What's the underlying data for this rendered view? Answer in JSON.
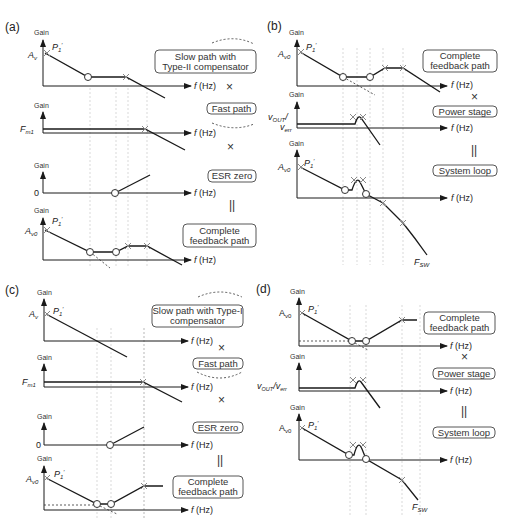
{
  "figure": {
    "panels": [
      {
        "id": "a",
        "label": "(a)",
        "plots": [
          {
            "y_label": "Gain",
            "y_value_label": "A",
            "y_value_sub": "v",
            "pole_label": "P",
            "pole_sub": "1",
            "pole_prime": "′",
            "x_label": "f (Hz)",
            "box": [
              "Slow path with",
              "Type-II compensator"
            ],
            "operator": "×"
          },
          {
            "y_label": "Gain",
            "y_value_label": "F",
            "y_value_sub": "m1",
            "x_label": "f (Hz)",
            "box": [
              "Fast path"
            ],
            "operator": "×"
          },
          {
            "y_label": "Gain",
            "y_value_label": "0",
            "x_label": "f (Hz)",
            "box": [
              "ESR zero"
            ],
            "operator": "||"
          },
          {
            "y_label": "Gain",
            "y_value_label": "A",
            "y_value_sub": "v0",
            "pole_label": "P",
            "pole_sub": "1",
            "pole_prime": "′",
            "x_label": "f (Hz)",
            "box": [
              "Complete",
              "feedback path"
            ]
          }
        ]
      },
      {
        "id": "b",
        "label": "(b)",
        "plots": [
          {
            "y_label": "Gain",
            "y_value_label": "A",
            "y_value_sub": "v0",
            "pole_label": "P",
            "pole_sub": "1",
            "pole_prime": "′",
            "x_label": "f (Hz)",
            "box": [
              "Complete",
              "feedback path"
            ],
            "operator": "×"
          },
          {
            "y_label": "Gain",
            "y_value_label": "v",
            "y_value_sub": "OUT",
            "y_value_label2": "v",
            "y_value_sub2": "err",
            "x_label": "f (Hz)",
            "box": [
              "Power stage"
            ],
            "operator": "||"
          },
          {
            "y_label": "Gain",
            "y_value_label": "A",
            "y_value_sub": "v0",
            "pole_label": "P",
            "pole_sub": "1",
            "pole_prime": "′",
            "x_label": "f (Hz)",
            "box": [
              "System loop"
            ],
            "end_label": "F",
            "end_sub": "SW"
          }
        ]
      },
      {
        "id": "c",
        "label": "(c)",
        "plots": [
          {
            "y_label": "Gain",
            "y_value_label": "A",
            "y_value_sub": "v",
            "pole_label": "P",
            "pole_sub": "1",
            "pole_prime": "′",
            "x_label": "f (Hz)",
            "box": [
              "Slow path with Type-I",
              "compensator"
            ],
            "operator": "×"
          },
          {
            "y_label": "Gain",
            "y_value_label": "F",
            "y_value_sub": "m1",
            "x_label": "f (Hz)",
            "box": [
              "Fast path"
            ],
            "operator": "×"
          },
          {
            "y_label": "Gain",
            "y_value_label": "0",
            "x_label": "f (Hz)",
            "box": [
              "ESR zero"
            ],
            "operator": "||"
          },
          {
            "y_label": "Gain",
            "y_value_label": "A",
            "y_value_sub": "v0",
            "pole_label": "P",
            "pole_sub": "1",
            "pole_prime": "′",
            "x_label": "f (Hz)",
            "box": [
              "Complete",
              "feedback path"
            ]
          }
        ]
      },
      {
        "id": "d",
        "label": "(d)",
        "plots": [
          {
            "y_label": "Gain",
            "y_value_label": "A",
            "y_value_sub": "v0",
            "pole_label": "P",
            "pole_sub": "1",
            "pole_prime": "′",
            "x_label": "f (Hz)",
            "box": [
              "Complete",
              "feedback path"
            ],
            "operator": "×"
          },
          {
            "y_label": "Gain",
            "y_value_label": "v",
            "y_value_sub": "OUT",
            "y_value_label2": "/v",
            "y_value_sub2": "err",
            "x_label": "f (Hz)",
            "box": [
              "Power stage"
            ],
            "operator": "||"
          },
          {
            "y_label": "Gain",
            "y_value_label": "A",
            "y_value_sub": "v0",
            "pole_label": "P",
            "pole_sub": "1",
            "pole_prime": "′",
            "x_label": "f (Hz)",
            "box": [
              "System loop"
            ],
            "end_label": "F",
            "end_sub": "SW"
          }
        ]
      }
    ]
  }
}
